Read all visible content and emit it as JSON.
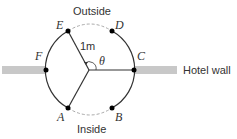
{
  "diagram": {
    "labels": {
      "outside": "Outside",
      "inside": "Inside",
      "hotel_wall": "Hotel wall",
      "radius": "1m",
      "angle": "θ"
    },
    "points": [
      {
        "id": "A",
        "label": "A"
      },
      {
        "id": "B",
        "label": "B"
      },
      {
        "id": "C",
        "label": "C"
      },
      {
        "id": "D",
        "label": "D"
      },
      {
        "id": "E",
        "label": "E"
      },
      {
        "id": "F",
        "label": "F"
      }
    ],
    "colors": {
      "wall": "#c8c8c8",
      "line": "#333333",
      "dashed": "#aaaaaa",
      "point": "#000000"
    }
  }
}
